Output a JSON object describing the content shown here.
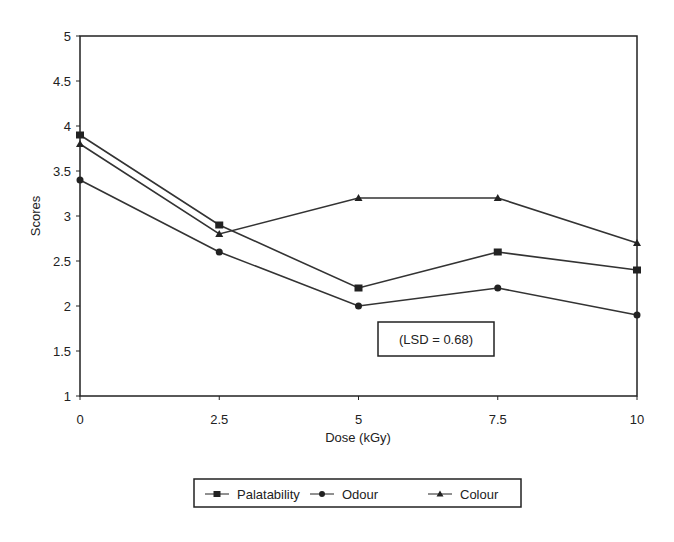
{
  "chart_data": {
    "type": "line",
    "title": "",
    "xlabel": "Dose (kGy)",
    "ylabel": "Scores",
    "x": [
      0,
      2.5,
      5,
      7.5,
      10
    ],
    "x_tick_labels": [
      "0",
      "2.5",
      "5",
      "7.5",
      "10"
    ],
    "y_tick_labels": [
      "1",
      "1.5",
      "2",
      "2.5",
      "3",
      "3.5",
      "4",
      "4.5",
      "5"
    ],
    "ylim": [
      1,
      5
    ],
    "xlim": [
      0,
      10
    ],
    "grid": false,
    "legend_position": "bottom",
    "series": [
      {
        "name": "Palatability",
        "marker": "square",
        "values": [
          3.9,
          2.9,
          2.2,
          2.6,
          2.4
        ]
      },
      {
        "name": "Odour",
        "marker": "circle",
        "values": [
          3.4,
          2.6,
          2.0,
          2.2,
          1.9
        ]
      },
      {
        "name": "Colour",
        "marker": "triangle",
        "values": [
          3.8,
          2.8,
          3.2,
          3.2,
          2.7
        ]
      }
    ],
    "annotations": [
      "(LSD = 0.68)"
    ]
  }
}
